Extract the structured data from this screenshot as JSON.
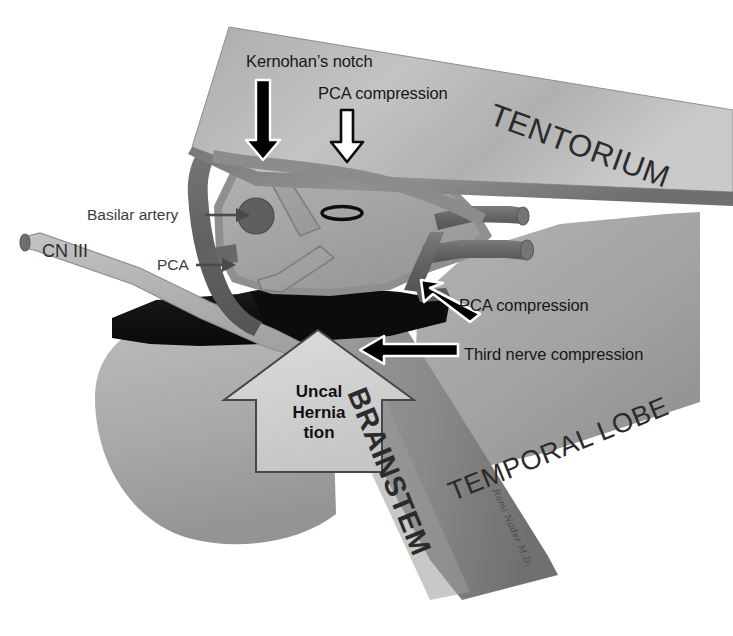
{
  "figure": {
    "background_color": "#ffffff"
  },
  "palette": {
    "tentorium_light": "#b9b9b9",
    "tentorium_dark": "#8e8e8e",
    "temporal_lobe": "#a0a0a0",
    "brainstem_mid": "#8a8a8a",
    "midbrain_light": "#adadad",
    "midbrain_mid": "#9a9a9a",
    "vessel_dark": "#6a6a6a",
    "nerve_light": "#b5b5b5",
    "uncus_black": "#141414",
    "arrow_black": "#000000",
    "arrow_outline": "#ffffff",
    "callout_box": "#d2d2d2",
    "text_dark": "#171717",
    "text_gray": "#3d3d3d"
  },
  "callouts": [
    {
      "id": "kernohans-notch",
      "label": "Kernohan’s notch",
      "arrow": "down",
      "fill": "black"
    },
    {
      "id": "pca-compression-top",
      "label": "PCA compression",
      "arrow": "down",
      "fill": "white-outlined"
    },
    {
      "id": "basilar-artery",
      "label": "Basilar artery",
      "arrow": "right",
      "fill": "gray"
    },
    {
      "id": "pca",
      "label": "PCA",
      "arrow": "right",
      "fill": "gray"
    },
    {
      "id": "cn-three",
      "label": "CN III",
      "arrow": "none",
      "fill": "gray"
    },
    {
      "id": "pca-compression-right",
      "label": "PCA compression",
      "arrow": "up-left",
      "fill": "black"
    },
    {
      "id": "third-nerve-compression",
      "label": "Third nerve compression",
      "arrow": "left",
      "fill": "black"
    }
  ],
  "structure_labels": [
    {
      "id": "tentorium",
      "label": "TENTORIUM",
      "rotation_deg": 20,
      "font_size": 31
    },
    {
      "id": "temporal-lobe",
      "label": "TEMPORAL LOBE",
      "rotation_deg": -22,
      "font_size": 27
    },
    {
      "id": "brainstem",
      "label": "BRAINSTEM",
      "rotation_deg": 68,
      "font_size": 29
    }
  ],
  "herniation_arrow": {
    "id": "uncal-herniation-arrow",
    "lines": [
      "Uncal",
      "Hernia",
      "tion"
    ],
    "direction": "up"
  },
  "signature": {
    "text": "Rami Nader M.D."
  }
}
